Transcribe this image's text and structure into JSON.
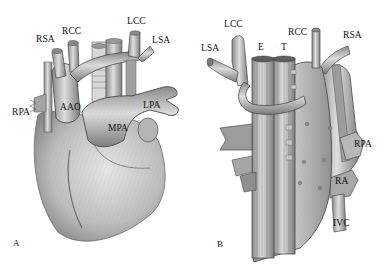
{
  "figure": {
    "panels": [
      {
        "id": "A",
        "label": "A",
        "view": "anterior",
        "structures": [
          {
            "key": "rsa",
            "text": "RSA"
          },
          {
            "key": "rcc",
            "text": "RCC"
          },
          {
            "key": "lcc",
            "text": "LCC"
          },
          {
            "key": "lsa",
            "text": "LSA"
          },
          {
            "key": "rpa",
            "text": "RPA"
          },
          {
            "key": "aao",
            "text": "AAO"
          },
          {
            "key": "lpa",
            "text": "LPA"
          },
          {
            "key": "mpa",
            "text": "MPA"
          }
        ]
      },
      {
        "id": "B",
        "label": "B",
        "view": "posterior",
        "structures": [
          {
            "key": "lcc",
            "text": "LCC"
          },
          {
            "key": "lsa",
            "text": "LSA"
          },
          {
            "key": "e",
            "text": "E"
          },
          {
            "key": "t",
            "text": "T"
          },
          {
            "key": "rcc",
            "text": "RCC"
          },
          {
            "key": "rsa",
            "text": "RSA"
          },
          {
            "key": "rpa",
            "text": "RPA"
          },
          {
            "key": "ra",
            "text": "RA"
          },
          {
            "key": "ivc",
            "text": "IVC"
          }
        ]
      }
    ]
  },
  "colors": {
    "background": "#ffffff",
    "label_text": "#111111",
    "vessel_light": "#d4d4d4",
    "vessel_mid": "#a8a8a8",
    "vessel_dark": "#6e6e6e",
    "outline": "#4a4a4a"
  }
}
